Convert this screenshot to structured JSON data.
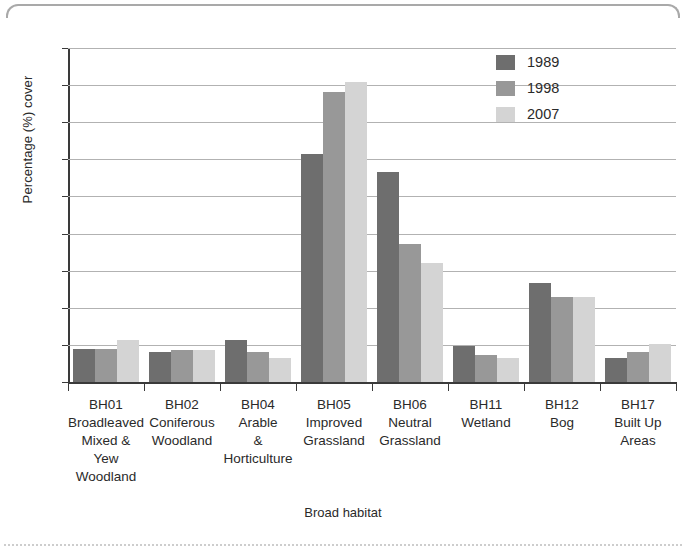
{
  "chart_data": {
    "type": "bar",
    "title": "",
    "xlabel": "Broad habitat",
    "ylabel": "Percentage (%) cover",
    "ylim": [
      0,
      45
    ],
    "ytick_step": 5,
    "yticks": [
      0,
      5,
      10,
      15,
      20,
      25,
      30,
      35,
      40,
      45
    ],
    "grid": true,
    "legend_position": "top-right",
    "categories": [
      "BH01\nBroadleaved\nMixed & Yew\nWoodland",
      "BH02\nConiferous\nWoodland",
      "BH04\nArable\n&\nHorticulture",
      "BH05\nImproved\nGrassland",
      "BH06\nNeutral\nGrassland",
      "BH11\nWetland",
      "BH12\nBog",
      "BH17\nBuilt Up\nAreas"
    ],
    "category_codes": [
      "BH01",
      "BH02",
      "BH04",
      "BH05",
      "BH06",
      "BH11",
      "BH12",
      "BH17"
    ],
    "category_names": [
      "Broadleaved Mixed & Yew Woodland",
      "Coniferous Woodland",
      "Arable & Horticulture",
      "Improved Grassland",
      "Neutral Grassland",
      "Wetland",
      "Bog",
      "Built Up Areas"
    ],
    "series": [
      {
        "name": "1989",
        "color": "#6e6e6e",
        "values": [
          4.4,
          4.0,
          5.7,
          30.7,
          28.3,
          4.9,
          13.3,
          3.3
        ]
      },
      {
        "name": "1998",
        "color": "#989898",
        "values": [
          4.5,
          4.3,
          4.0,
          39.1,
          18.6,
          3.7,
          11.4,
          4.0
        ]
      },
      {
        "name": "2007",
        "color": "#d4d4d4",
        "values": [
          5.7,
          4.3,
          3.2,
          40.4,
          16.0,
          3.2,
          11.4,
          5.1
        ]
      }
    ]
  }
}
